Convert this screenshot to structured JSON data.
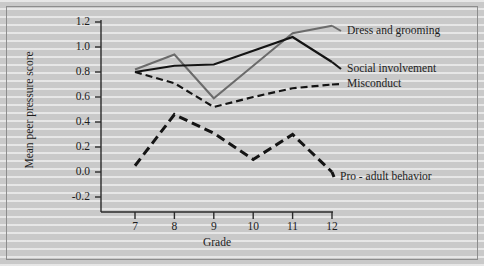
{
  "chart_data": {
    "type": "line",
    "title": "",
    "xlabel": "Grade",
    "ylabel": "Mean peer pressure score",
    "categories": [
      7,
      8,
      9,
      10,
      11,
      12
    ],
    "xtick_labels": [
      "7",
      "8",
      "9",
      "10",
      "11",
      "12"
    ],
    "ytick_labels": [
      "-0.2",
      "0.0",
      "0.2",
      "0.4",
      "0.6",
      "0.8",
      "1.0",
      "1.2"
    ],
    "ytick_values": [
      -0.2,
      0.0,
      0.2,
      0.4,
      0.6,
      0.8,
      1.0,
      1.2
    ],
    "ylim": [
      -0.3,
      1.25
    ],
    "xlim": [
      6.5,
      12.3
    ],
    "grid": false,
    "legend_position": "inline-right-of-lines",
    "series": [
      {
        "name": "Dress and grooming",
        "values": [
          0.82,
          0.94,
          0.59,
          0.85,
          1.11,
          1.17
        ],
        "color": "#6b6b6b",
        "style": "solid",
        "width": 2.0,
        "label_x": 345,
        "label_y": 25
      },
      {
        "name": "Social involvement",
        "values": [
          0.8,
          0.85,
          0.86,
          0.97,
          1.08,
          0.88
        ],
        "color": "#141414",
        "style": "solid",
        "width": 2.2,
        "label_x": 345,
        "label_y": 63
      },
      {
        "name": "Misconduct",
        "values": [
          0.8,
          0.71,
          0.52,
          0.6,
          0.67,
          0.7
        ],
        "color": "#141414",
        "style": "dashed",
        "width": 2.2,
        "label_x": 345,
        "label_y": 78
      },
      {
        "name": "Pro - adult behavior",
        "values": [
          0.05,
          0.46,
          0.31,
          0.1,
          0.3,
          0.0
        ],
        "color": "#141414",
        "style": "dashed-heavy",
        "width": 3.0,
        "label_x": 338,
        "label_y": 171
      }
    ]
  }
}
